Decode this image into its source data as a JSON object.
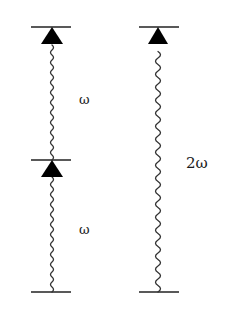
{
  "diagram": {
    "type": "energy-level transitions",
    "left_transitions": [
      {
        "label": "ω",
        "from_level": "middle",
        "to_level": "top"
      },
      {
        "label": "ω",
        "from_level": "bottom",
        "to_level": "middle"
      }
    ],
    "right_transitions": [
      {
        "label": "2ω",
        "from_level": "bottom",
        "to_level": "top"
      }
    ],
    "colors": {
      "line": "#1a1a1a",
      "background": "#ffffff"
    }
  }
}
